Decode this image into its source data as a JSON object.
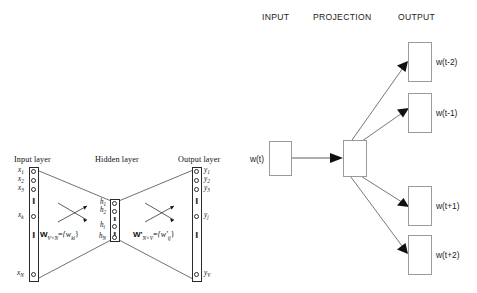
{
  "left_diagram": {
    "name": "cbow-network-diagram",
    "layer_titles": {
      "input": "Input layer",
      "hidden": "Hidden layer",
      "output": "Output layer"
    },
    "input_units": [
      "x1",
      "x2",
      "x3",
      "xk",
      "xN"
    ],
    "input_labels": [
      {
        "base": "x",
        "sub": "1"
      },
      {
        "base": "x",
        "sub": "2"
      },
      {
        "base": "x",
        "sub": "3"
      },
      {
        "base": "x",
        "sub": "k"
      },
      {
        "base": "x",
        "sub": "N"
      }
    ],
    "hidden_labels": [
      {
        "base": "h",
        "sub": "1"
      },
      {
        "base": "h",
        "sub": "2"
      },
      {
        "base": "h",
        "sub": "i"
      },
      {
        "base": "h",
        "sub": "N"
      }
    ],
    "output_labels": [
      {
        "base": "y",
        "sub": "1"
      },
      {
        "base": "y",
        "sub": "2"
      },
      {
        "base": "y",
        "sub": "3"
      },
      {
        "base": "y",
        "sub": "j"
      },
      {
        "base": "y",
        "sub": "V"
      }
    ],
    "weight_matrix_left": {
      "matrix": "W",
      "dims": "V×N",
      "equals": "=",
      "entries": "{w",
      "entry_sub": "ki",
      "entries_close": "}"
    },
    "weight_matrix_right": {
      "matrix": "W'",
      "dims": "N×V",
      "equals": "=",
      "entries": "{w'",
      "entry_sub": "ij",
      "entries_close": "}"
    },
    "ellipsis_glyph": "⋮"
  },
  "right_diagram": {
    "name": "skip-gram-diagram",
    "headers": {
      "input": "INPUT",
      "projection": "PROJECTION",
      "output": "OUTPUT"
    },
    "input_box_label": "w(t)",
    "projection_box_label": "",
    "output_box_labels": [
      "w(t-2)",
      "w(t-1)",
      "w(t+1)",
      "w(t+2)"
    ]
  },
  "colors": {
    "stroke_dark": "#2a2a2a",
    "stroke_light": "#9a9a9a",
    "arrow_fill": "#111111",
    "background": "#ffffff",
    "text": "#111111"
  }
}
